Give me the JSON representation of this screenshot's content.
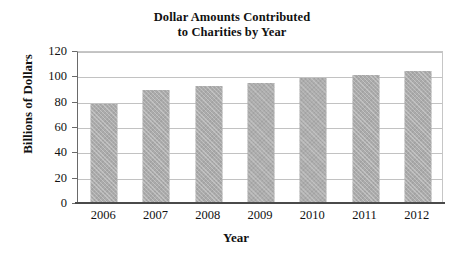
{
  "chart_data": {
    "type": "bar",
    "title": "Dollar Amounts Contributed to Charities by Year",
    "title_lines": [
      "Dollar Amounts Contributed",
      "to Charities by Year"
    ],
    "categories": [
      "2006",
      "2007",
      "2008",
      "2009",
      "2010",
      "2011",
      "2012"
    ],
    "values": [
      78,
      89,
      92,
      95,
      99,
      101,
      104
    ],
    "xlabel": "Year",
    "ylabel": "Billions of Dollars",
    "ylim": [
      0,
      120
    ],
    "ytick_values": [
      0,
      20,
      40,
      60,
      80,
      100,
      120
    ],
    "ytick_labels": [
      "0",
      "20",
      "40",
      "60",
      "80",
      "100",
      "120"
    ],
    "grid": true,
    "legend": false,
    "series": [
      {
        "name": "Dollar Amounts Contributed",
        "values": [
          78,
          89,
          92,
          95,
          99,
          101,
          104
        ]
      }
    ],
    "colors": {
      "bar_fill": "#ababab",
      "gridline": "#c2c2c2",
      "axis": "#4a4a4a",
      "text": "#111111",
      "background": "#ffffff"
    }
  }
}
